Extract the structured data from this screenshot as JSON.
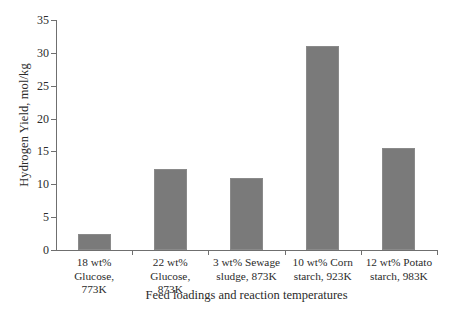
{
  "chart_data": {
    "type": "bar",
    "title": "",
    "xlabel": "Feed loadings and reaction temperatures",
    "ylabel": "Hydrogen Yield, mol/kg",
    "categories": [
      "18 wt% Glucose, 773K",
      "22 wt% Glucose, 873K",
      "3 wt% Sewage sludge, 873K",
      "10 wt% Corn starch,  923K",
      "12 wt% Potato starch, 983K"
    ],
    "category_lines": [
      [
        "18 wt% Glucose,",
        "773K"
      ],
      [
        "22 wt% Glucose,",
        "873K"
      ],
      [
        "3 wt% Sewage",
        "sludge, 873K"
      ],
      [
        "10 wt% Corn",
        "starch,  923K"
      ],
      [
        "12 wt% Potato",
        "starch, 983K"
      ]
    ],
    "values": [
      2.4,
      12.4,
      11.0,
      31.0,
      15.5
    ],
    "ylim": [
      0,
      35
    ],
    "yticks": [
      0,
      5,
      10,
      15,
      20,
      25,
      30,
      35
    ],
    "ytick_labels": [
      "0",
      "5",
      "10",
      "15",
      "20",
      "25",
      "30",
      "35"
    ],
    "grid": false,
    "legend": false,
    "bar_color": "#7a7a7a",
    "axis_color": "#6f6f6f",
    "background": "#ffffff"
  }
}
